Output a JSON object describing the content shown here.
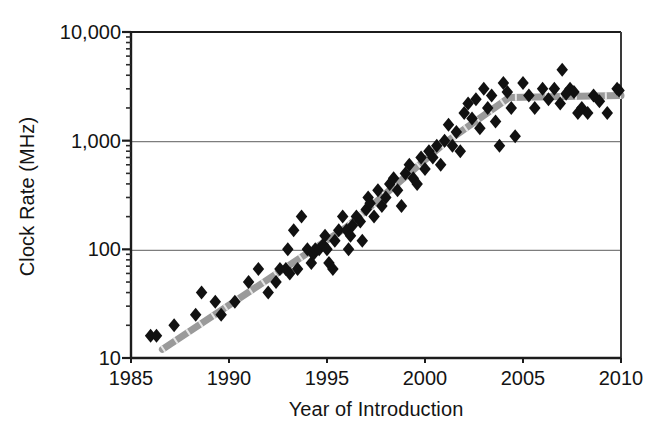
{
  "chart_data": {
    "type": "scatter",
    "title": "",
    "xlabel": "Year of Introduction",
    "ylabel": "Clock Rate (MHz)",
    "xlim": [
      1985,
      2010
    ],
    "ylim": [
      10,
      10000
    ],
    "yscale": "log",
    "xscale": "linear",
    "grid": "horizontal-major-only",
    "legend": "none",
    "xticks": [
      "1985",
      "1990",
      "1995",
      "2000",
      "2005",
      "2010"
    ],
    "xtick_values": [
      1985,
      1990,
      1995,
      2000,
      2005,
      2010
    ],
    "yticks": [
      "10",
      "100",
      "1,000",
      "10,000"
    ],
    "ytick_values": [
      10,
      100,
      1000,
      10000
    ],
    "marker": "diamond",
    "marker_color": "#111111",
    "marker_size": 7,
    "series": [
      {
        "name": "Processor clock rate",
        "points": [
          [
            1986.0,
            16
          ],
          [
            1986.3,
            16
          ],
          [
            1987.2,
            20
          ],
          [
            1988.3,
            25
          ],
          [
            1988.6,
            40
          ],
          [
            1989.3,
            33
          ],
          [
            1989.6,
            25
          ],
          [
            1990.3,
            33
          ],
          [
            1991.0,
            50
          ],
          [
            1991.5,
            66
          ],
          [
            1992.0,
            40
          ],
          [
            1992.4,
            50
          ],
          [
            1992.6,
            66
          ],
          [
            1992.9,
            66
          ],
          [
            1993.0,
            100
          ],
          [
            1993.1,
            60
          ],
          [
            1993.3,
            150
          ],
          [
            1993.5,
            66
          ],
          [
            1993.7,
            200
          ],
          [
            1994.0,
            100
          ],
          [
            1994.2,
            75
          ],
          [
            1994.3,
            90
          ],
          [
            1994.4,
            100
          ],
          [
            1994.6,
            100
          ],
          [
            1994.8,
            110
          ],
          [
            1994.9,
            133
          ],
          [
            1995.0,
            100
          ],
          [
            1995.1,
            75
          ],
          [
            1995.3,
            66
          ],
          [
            1995.4,
            120
          ],
          [
            1995.6,
            150
          ],
          [
            1995.8,
            200
          ],
          [
            1996.0,
            150
          ],
          [
            1996.1,
            100
          ],
          [
            1996.2,
            133
          ],
          [
            1996.3,
            166
          ],
          [
            1996.5,
            200
          ],
          [
            1996.7,
            180
          ],
          [
            1996.8,
            120
          ],
          [
            1997.0,
            233
          ],
          [
            1997.1,
            300
          ],
          [
            1997.2,
            266
          ],
          [
            1997.4,
            200
          ],
          [
            1997.6,
            350
          ],
          [
            1997.8,
            250
          ],
          [
            1998.0,
            300
          ],
          [
            1998.2,
            400
          ],
          [
            1998.4,
            450
          ],
          [
            1998.6,
            350
          ],
          [
            1998.8,
            250
          ],
          [
            1999.0,
            500
          ],
          [
            1999.2,
            600
          ],
          [
            1999.4,
            450
          ],
          [
            1999.6,
            400
          ],
          [
            1999.8,
            700
          ],
          [
            2000.0,
            550
          ],
          [
            2000.2,
            800
          ],
          [
            2000.4,
            700
          ],
          [
            2000.6,
            900
          ],
          [
            2000.8,
            600
          ],
          [
            2001.0,
            1000
          ],
          [
            2001.2,
            1400
          ],
          [
            2001.4,
            900
          ],
          [
            2001.6,
            1200
          ],
          [
            2001.8,
            800
          ],
          [
            2002.0,
            1800
          ],
          [
            2002.2,
            2200
          ],
          [
            2002.4,
            1600
          ],
          [
            2002.6,
            2400
          ],
          [
            2002.8,
            1300
          ],
          [
            2003.0,
            3000
          ],
          [
            2003.2,
            2000
          ],
          [
            2003.4,
            2600
          ],
          [
            2003.6,
            1500
          ],
          [
            2003.8,
            900
          ],
          [
            2004.0,
            3400
          ],
          [
            2004.2,
            2800
          ],
          [
            2004.4,
            2000
          ],
          [
            2004.6,
            1100
          ],
          [
            2005.0,
            3400
          ],
          [
            2005.3,
            2600
          ],
          [
            2005.6,
            2000
          ],
          [
            2006.0,
            3000
          ],
          [
            2006.3,
            2400
          ],
          [
            2006.6,
            3000
          ],
          [
            2006.9,
            2200
          ],
          [
            2007.0,
            4500
          ],
          [
            2007.2,
            2700
          ],
          [
            2007.4,
            3000
          ],
          [
            2007.6,
            2800
          ],
          [
            2007.8,
            1800
          ],
          [
            2008.0,
            2000
          ],
          [
            2008.3,
            1800
          ],
          [
            2008.6,
            2600
          ],
          [
            2008.9,
            2300
          ],
          [
            2009.3,
            1800
          ],
          [
            2009.8,
            3000
          ],
          [
            2009.9,
            2900
          ]
        ]
      }
    ],
    "trend_line": {
      "name": "fitted trend",
      "color": "#9a9a9a",
      "width": 7,
      "style": "dashed-thick",
      "vertices": [
        [
          1986.6,
          12
        ],
        [
          1996.0,
          160
        ],
        [
          2001.0,
          950
        ],
        [
          2004.3,
          2500
        ],
        [
          2010.0,
          2600
        ]
      ],
      "description": "Steep exponential growth until about 2004, then a flat plateau near 2500 MHz."
    },
    "annotations": []
  },
  "axis": {
    "ylabel": "Clock Rate (MHz)",
    "xlabel": "Year of Introduction",
    "ytick_labels": [
      "10,000",
      "1,000",
      "100",
      "10"
    ],
    "xtick_labels": [
      "1985",
      "1990",
      "1995",
      "2000",
      "2005",
      "2010"
    ]
  },
  "colors": {
    "axis": "#1a1a1a",
    "grid": "#7a7a7a",
    "marker": "#111111",
    "trend": "#9c9c9c",
    "text": "#141414",
    "background": "#ffffff"
  }
}
